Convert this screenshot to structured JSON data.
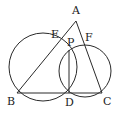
{
  "diagram": {
    "type": "geometry",
    "points": {
      "A": "A",
      "B": "B",
      "C": "C",
      "D": "D",
      "E": "E",
      "F": "F",
      "P": "P"
    },
    "segments": [
      "AB",
      "AC",
      "BC",
      "PD"
    ],
    "circles": [
      {
        "name": "circle-BDPE",
        "through": [
          "B",
          "D",
          "P",
          "E"
        ]
      },
      {
        "name": "circle-PDCF",
        "through": [
          "P",
          "D",
          "C",
          "F"
        ]
      }
    ]
  }
}
